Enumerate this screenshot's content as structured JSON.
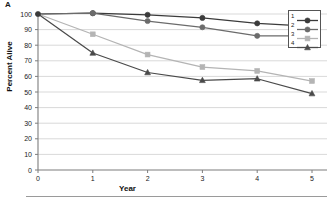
{
  "panel": {
    "label": "A"
  },
  "chart_data": {
    "type": "line",
    "title": "",
    "xlabel": "Year",
    "ylabel": "Percent Alive",
    "xlim": [
      0,
      5
    ],
    "ylim": [
      0,
      100
    ],
    "x": [
      0,
      1,
      2,
      3,
      4,
      5
    ],
    "xticks": [
      "0",
      "1",
      "2",
      "3",
      "4",
      "5"
    ],
    "yticks": [
      "0",
      "10",
      "20",
      "30",
      "40",
      "50",
      "60",
      "70",
      "80",
      "90",
      "100"
    ],
    "grid": "horizontal",
    "legend_position": "top-right",
    "series": [
      {
        "name": "1",
        "values": [
          100,
          100.5,
          99.5,
          97.5,
          94,
          92
        ],
        "color": "#3b3b3b",
        "marker": "circle"
      },
      {
        "name": "2",
        "values": [
          100,
          100.5,
          95.5,
          91.5,
          86,
          86
        ],
        "color": "#6b6b6b",
        "marker": "circle"
      },
      {
        "name": "3",
        "values": [
          100,
          87,
          74,
          66,
          63.5,
          57
        ],
        "color": "#b4b4b4",
        "marker": "square"
      },
      {
        "name": "4",
        "values": [
          100,
          75,
          62.5,
          57.5,
          58.5,
          49
        ],
        "color": "#4a4a4a",
        "marker": "triangle"
      }
    ]
  },
  "legend": {
    "items": [
      {
        "label": "1"
      },
      {
        "label": "2"
      },
      {
        "label": "3"
      },
      {
        "label": "4"
      }
    ]
  },
  "colors": {
    "axis": "#7d7d7d",
    "grid": "#c8c8c8",
    "text": "#1a1a1a"
  }
}
